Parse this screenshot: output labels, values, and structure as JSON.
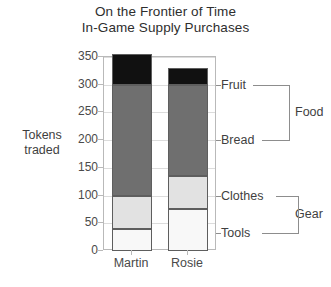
{
  "chart_data": {
    "type": "bar",
    "subtype": "stacked-bar",
    "title": "On the Frontier of Time",
    "subtitle": "In-Game Supply Purchases",
    "xlabel": "",
    "ylabel": "Tokens traded",
    "ylim": [
      0,
      350
    ],
    "ytick_step": 50,
    "yticks": [
      350,
      300,
      250,
      200,
      150,
      100,
      50,
      0
    ],
    "ytick_labels": [
      "350",
      "300",
      "250",
      "200",
      "150",
      "100",
      "50",
      "0"
    ],
    "grid": true,
    "legend_position": "right-annotations",
    "categories": [
      "Martin",
      "Rosie"
    ],
    "series": [
      {
        "name": "Tools",
        "group": "Gear",
        "color": "#f8f8f8",
        "values": [
          40,
          75
        ]
      },
      {
        "name": "Clothes",
        "group": "Gear",
        "color": "#e2e2e2",
        "values": [
          60,
          60
        ]
      },
      {
        "name": "Bread",
        "group": "Food",
        "color": "#6f6f6f",
        "values": [
          200,
          165
        ]
      },
      {
        "name": "Fruit",
        "group": "Food",
        "color": "#111111",
        "values": [
          55,
          30
        ]
      }
    ],
    "totals": [
      355,
      330
    ],
    "groups": [
      {
        "name": "Food",
        "members": [
          "Fruit",
          "Bread"
        ]
      },
      {
        "name": "Gear",
        "members": [
          "Clothes",
          "Tools"
        ]
      }
    ],
    "annotations": {
      "fruit_label": "Fruit",
      "bread_label": "Bread",
      "food_label": "Food",
      "clothes_label": "Clothes",
      "tools_label": "Tools",
      "gear_label": "Gear"
    }
  }
}
